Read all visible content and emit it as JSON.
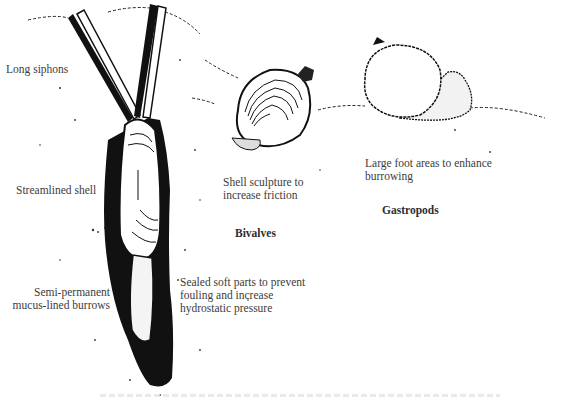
{
  "figure": {
    "labels": {
      "long_siphons": "Long siphons",
      "streamlined_shell": "Streamlined shell",
      "burrows_line1": "Semi-permanent",
      "burrows_line2": "mucus-lined burrows",
      "sealed_line1": "Sealed soft parts to prevent",
      "sealed_line2": "fouling and increase",
      "sealed_line3": "hydrostatic pressure",
      "sculpture_line1": "Shell sculpture to",
      "sculpture_line2": "increase friction",
      "foot_line1": "Large foot areas to enhance",
      "foot_line2": "burrowing"
    },
    "groups": {
      "bivalves": "Bivalves",
      "gastropods": "Gastropods"
    },
    "illustrations": [
      {
        "name": "razor-clam-in-burrow",
        "group": "Bivalves"
      },
      {
        "name": "clam-shell",
        "group": "Bivalves"
      },
      {
        "name": "gastropod-snail",
        "group": "Gastropods"
      }
    ],
    "colors": {
      "ink": "#111111",
      "text": "#3c3c3c",
      "background": "#ffffff"
    }
  }
}
